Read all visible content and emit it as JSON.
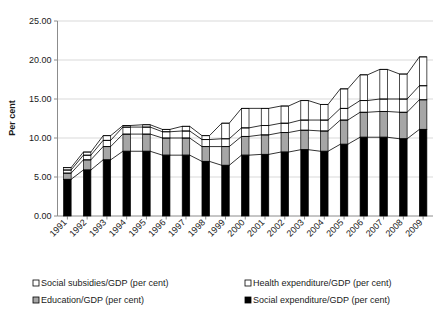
{
  "chart_data": {
    "type": "bar",
    "stacked": true,
    "title": "",
    "xlabel": "",
    "ylabel": "Per cent",
    "ylim": [
      0,
      25
    ],
    "ytick_step": 5,
    "ytick_labels": [
      "0.00",
      "5.00",
      "10.00",
      "15.00",
      "20.00",
      "25.00"
    ],
    "ytick_values": [
      0,
      5,
      10,
      15,
      20,
      25
    ],
    "grid": true,
    "legend_position": "bottom",
    "categories": [
      "1991",
      "1992",
      "1993",
      "1994",
      "1995",
      "1996",
      "1997",
      "1998",
      "1999",
      "2000",
      "2001",
      "2002",
      "2003",
      "2004",
      "2005",
      "2006",
      "2007",
      "2008",
      "2009"
    ],
    "series": [
      {
        "name": "Social expenditure/GDP (per cent)",
        "color": "#000000",
        "marker": "filled-square",
        "values": [
          4.7,
          5.9,
          7.2,
          8.3,
          8.3,
          7.8,
          7.8,
          7.0,
          6.5,
          7.8,
          7.9,
          8.2,
          8.5,
          8.3,
          9.2,
          10.1,
          10.1,
          9.9,
          11.1
        ]
      },
      {
        "name": "Education/GDP (per cent)",
        "color": "#a6a6a6",
        "marker": "gray-square",
        "values": [
          0.8,
          1.3,
          1.7,
          2.2,
          2.2,
          2.2,
          2.2,
          1.9,
          2.4,
          2.4,
          2.5,
          2.5,
          2.5,
          2.6,
          3.1,
          3.2,
          3.3,
          3.4,
          3.8
        ]
      },
      {
        "name": "Health expenditure/GDP (per cent)",
        "color": "#ffffff",
        "marker": "open-square",
        "values": [
          0.4,
          0.6,
          0.8,
          0.9,
          0.9,
          0.8,
          0.9,
          0.9,
          1.0,
          1.1,
          1.2,
          1.2,
          1.3,
          1.4,
          1.5,
          1.5,
          1.6,
          1.7,
          1.8
        ]
      },
      {
        "name": "Social subsidies/GDP (per cent)",
        "color": "#ffffff",
        "marker": "open-square",
        "values": [
          0.3,
          0.4,
          0.6,
          0.2,
          0.3,
          0.3,
          0.6,
          0.5,
          2.0,
          2.5,
          2.2,
          2.2,
          2.5,
          2.0,
          2.5,
          3.3,
          3.8,
          3.2,
          3.7
        ]
      }
    ],
    "totals": [
      6.2,
      8.2,
      10.3,
      11.6,
      11.7,
      11.1,
      11.5,
      10.3,
      11.9,
      13.8,
      13.8,
      14.1,
      14.8,
      14.3,
      16.3,
      18.1,
      18.8,
      18.2,
      20.4
    ]
  },
  "legend": {
    "entries": [
      {
        "label": "Social subsidies/GDP (per cent)",
        "marker": "open-square"
      },
      {
        "label": "Health expenditure/GDP (per cent)",
        "marker": "open-square"
      },
      {
        "label": "Education/GDP (per cent)",
        "marker": "gray-square"
      },
      {
        "label": "Social expenditure/GDP (per cent)",
        "marker": "filled-square"
      }
    ]
  },
  "axes": {
    "y_title": "Per cent"
  }
}
